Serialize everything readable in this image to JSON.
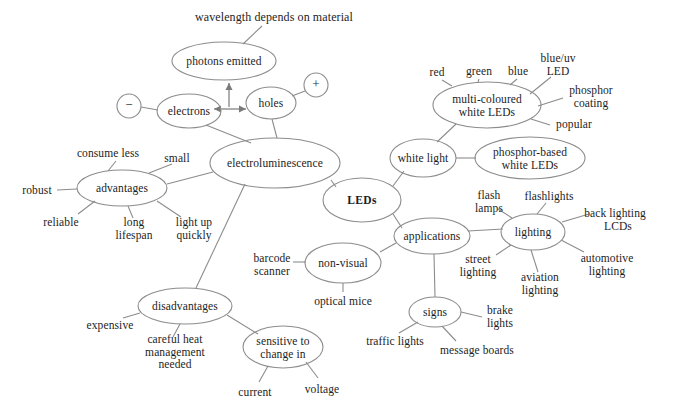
{
  "diagram": {
    "type": "mind-map",
    "stroke_color": "#8c8c8c",
    "text_color": "#1d1d1d",
    "background_color": "#ffffff",
    "root": "LEDs",
    "nodes": [
      {
        "id": "leds",
        "label": "LEDs",
        "shape": "ellipse",
        "bold": true,
        "cx": 362,
        "cy": 200,
        "rx": 39,
        "ry": 22
      },
      {
        "id": "electro",
        "label": "electroluminescence",
        "shape": "ellipse",
        "bold": false,
        "cx": 275,
        "cy": 163,
        "rx": 65,
        "ry": 25
      },
      {
        "id": "whitelight",
        "label": "white light",
        "shape": "ellipse",
        "bold": false,
        "cx": 423,
        "cy": 158,
        "rx": 33,
        "ry": 19
      },
      {
        "id": "applications",
        "label": "applications",
        "shape": "ellipse",
        "bold": false,
        "cx": 432,
        "cy": 236,
        "rx": 38,
        "ry": 18
      },
      {
        "id": "advantages",
        "label": "advantages",
        "shape": "ellipse",
        "bold": false,
        "cx": 122,
        "cy": 188,
        "rx": 45,
        "ry": 18
      },
      {
        "id": "disadvantages",
        "label": "disadvantages",
        "shape": "ellipse",
        "bold": false,
        "cx": 185,
        "cy": 306,
        "rx": 47,
        "ry": 18
      },
      {
        "id": "photons",
        "label": "photons emitted",
        "shape": "ellipse",
        "bold": false,
        "cx": 224,
        "cy": 61,
        "rx": 52,
        "ry": 19
      },
      {
        "id": "electrons",
        "label": "electrons",
        "shape": "ellipse",
        "bold": false,
        "cx": 189,
        "cy": 111,
        "rx": 32,
        "ry": 17
      },
      {
        "id": "holes",
        "label": "holes",
        "shape": "ellipse",
        "bold": false,
        "cx": 271,
        "cy": 103,
        "rx": 25,
        "ry": 16
      },
      {
        "id": "minus",
        "label": "−",
        "shape": "ellipse",
        "bold": false,
        "cx": 129,
        "cy": 106,
        "rx": 12,
        "ry": 12
      },
      {
        "id": "plus",
        "label": "+",
        "shape": "ellipse",
        "bold": false,
        "cx": 316,
        "cy": 85,
        "rx": 12,
        "ry": 12
      },
      {
        "id": "multicoloured",
        "label": "multi-coloured\nwhite LEDs",
        "shape": "ellipse",
        "bold": false,
        "cx": 487,
        "cy": 105,
        "rx": 54,
        "ry": 23
      },
      {
        "id": "phosphorbased",
        "label": "phosphor-based\nwhite LEDs",
        "shape": "ellipse",
        "bold": false,
        "cx": 530,
        "cy": 158,
        "rx": 55,
        "ry": 21
      },
      {
        "id": "lighting",
        "label": "lighting",
        "shape": "ellipse",
        "bold": false,
        "cx": 533,
        "cy": 232,
        "rx": 32,
        "ry": 18
      },
      {
        "id": "nonvisual",
        "label": "non-visual",
        "shape": "ellipse",
        "bold": false,
        "cx": 343,
        "cy": 263,
        "rx": 38,
        "ry": 20
      },
      {
        "id": "signs",
        "label": "signs",
        "shape": "ellipse",
        "bold": false,
        "cx": 435,
        "cy": 312,
        "rx": 26,
        "ry": 15
      },
      {
        "id": "sensitive",
        "label": "sensitive to\nchange in",
        "shape": "ellipse",
        "bold": false,
        "cx": 283,
        "cy": 347,
        "rx": 40,
        "ry": 21
      }
    ],
    "leaves": [
      {
        "id": "wavelength",
        "label": "wavelength depends on material",
        "x": 274,
        "y": 17,
        "align": "center"
      },
      {
        "id": "small",
        "label": "small",
        "x": 177,
        "y": 158,
        "align": "center"
      },
      {
        "id": "consume-less",
        "label": "consume less",
        "x": 108,
        "y": 153,
        "align": "center"
      },
      {
        "id": "robust",
        "label": "robust",
        "x": 37,
        "y": 190,
        "align": "center"
      },
      {
        "id": "reliable",
        "label": "reliable",
        "x": 61,
        "y": 222,
        "align": "center"
      },
      {
        "id": "long-lifespan",
        "label": "long\nlifespan",
        "x": 134,
        "y": 228,
        "align": "center"
      },
      {
        "id": "light-up-quickly",
        "label": "light up\nquickly",
        "x": 194,
        "y": 228,
        "align": "center"
      },
      {
        "id": "expensive",
        "label": "expensive",
        "x": 110,
        "y": 325,
        "align": "center"
      },
      {
        "id": "careful-heat",
        "label": "careful heat\nmanagement\nneeded",
        "x": 175,
        "y": 352,
        "align": "center"
      },
      {
        "id": "current",
        "label": "current",
        "x": 255,
        "y": 392,
        "align": "center"
      },
      {
        "id": "voltage",
        "label": "voltage",
        "x": 322,
        "y": 389,
        "align": "center"
      },
      {
        "id": "barcode-scanner",
        "label": "barcode\nscanner",
        "x": 272,
        "y": 264,
        "align": "center"
      },
      {
        "id": "optical-mice",
        "label": "optical mice",
        "x": 343,
        "y": 301,
        "align": "center"
      },
      {
        "id": "traffic-lights",
        "label": "traffic lights",
        "x": 395,
        "y": 341,
        "align": "center"
      },
      {
        "id": "message-boards",
        "label": "message boards",
        "x": 477,
        "y": 350,
        "align": "center"
      },
      {
        "id": "brake-lights",
        "label": "brake\nlights",
        "x": 500,
        "y": 316,
        "align": "center"
      },
      {
        "id": "street-lighting",
        "label": "street\nlighting",
        "x": 478,
        "y": 265,
        "align": "center"
      },
      {
        "id": "aviation-lighting",
        "label": "aviation\nlighting",
        "x": 540,
        "y": 283,
        "align": "center"
      },
      {
        "id": "automotive-lighting",
        "label": "automotive\nlighting",
        "x": 607,
        "y": 264,
        "align": "center"
      },
      {
        "id": "back-lighting-lcds",
        "label": "back lighting\n  LCDs",
        "x": 615,
        "y": 219,
        "align": "center"
      },
      {
        "id": "flashlights",
        "label": "flashlights",
        "x": 549,
        "y": 196,
        "align": "center"
      },
      {
        "id": "flash-lamps",
        "label": "flash\nlamps",
        "x": 489,
        "y": 201,
        "align": "center"
      },
      {
        "id": "red",
        "label": "red",
        "x": 437,
        "y": 72,
        "align": "center"
      },
      {
        "id": "green",
        "label": "green",
        "x": 479,
        "y": 71,
        "align": "center"
      },
      {
        "id": "blue",
        "label": "blue",
        "x": 518,
        "y": 71,
        "align": "center"
      },
      {
        "id": "blue-uv-led",
        "label": "blue/uv\nLED",
        "x": 558,
        "y": 64,
        "align": "center"
      },
      {
        "id": "phosphor-coating",
        "label": "phosphor\ncoating",
        "x": 591,
        "y": 96,
        "align": "center"
      },
      {
        "id": "popular",
        "label": "popular",
        "x": 574,
        "y": 124,
        "align": "center"
      }
    ],
    "edges": [
      {
        "from": "electro",
        "to": "leds",
        "x1": 331,
        "y1": 180,
        "x2": 336,
        "y2": 187
      },
      {
        "from": "leds",
        "to": "whitelight",
        "x1": 393,
        "y1": 186,
        "x2": 404,
        "y2": 171
      },
      {
        "from": "leds",
        "to": "applications",
        "x1": 393,
        "y1": 214,
        "x2": 400,
        "y2": 228
      },
      {
        "from": "electro",
        "to": "advantages",
        "x1": 213,
        "y1": 172,
        "x2": 167,
        "y2": 184
      },
      {
        "from": "electro",
        "to": "disadvantages",
        "x1": 244,
        "y1": 185,
        "x2": 195,
        "y2": 288
      },
      {
        "from": "electro",
        "to": "electrons",
        "x1": 253,
        "y1": 141,
        "x2": 205,
        "y2": 126
      },
      {
        "from": "electro",
        "to": "holes",
        "x1": 278,
        "y1": 138,
        "x2": 272,
        "y2": 119
      },
      {
        "from": "photons",
        "to": "wavelength",
        "x1": 243,
        "y1": 44,
        "x2": 262,
        "y2": 26
      },
      {
        "from": "minus",
        "to": "electrons",
        "x1": 141,
        "y1": 107,
        "x2": 158,
        "y2": 110
      },
      {
        "from": "plus",
        "to": "holes",
        "x1": 305,
        "y1": 91,
        "x2": 291,
        "y2": 97
      },
      {
        "from": "advantages",
        "to": "consume-less",
        "x1": 108,
        "y1": 171,
        "x2": 116,
        "y2": 161
      },
      {
        "from": "advantages",
        "to": "small",
        "x1": 148,
        "y1": 173,
        "x2": 171,
        "y2": 164
      },
      {
        "from": "advantages",
        "to": "robust",
        "x1": 77,
        "y1": 189,
        "x2": 57,
        "y2": 190
      },
      {
        "from": "advantages",
        "to": "reliable",
        "x1": 93,
        "y1": 201,
        "x2": 77,
        "y2": 215
      },
      {
        "from": "advantages",
        "to": "long-lifespan",
        "x1": 127,
        "y1": 206,
        "x2": 132,
        "y2": 218
      },
      {
        "from": "advantages",
        "to": "light-up",
        "x1": 156,
        "y1": 202,
        "x2": 180,
        "y2": 217
      },
      {
        "from": "disadvantages",
        "to": "expensive",
        "x1": 140,
        "y1": 313,
        "x2": 122,
        "y2": 318
      },
      {
        "from": "disadvantages",
        "to": "careful-heat",
        "x1": 179,
        "y1": 324,
        "x2": 172,
        "y2": 337
      },
      {
        "from": "disadvantages",
        "to": "sensitive",
        "x1": 227,
        "y1": 315,
        "x2": 258,
        "y2": 334
      },
      {
        "from": "sensitive",
        "to": "current",
        "x1": 268,
        "y1": 366,
        "x2": 258,
        "y2": 382
      },
      {
        "from": "sensitive",
        "to": "voltage",
        "x1": 306,
        "y1": 362,
        "x2": 318,
        "y2": 378
      },
      {
        "from": "applications",
        "to": "nonvisual",
        "x1": 396,
        "y1": 243,
        "x2": 379,
        "y2": 253
      },
      {
        "from": "applications",
        "to": "signs",
        "x1": 434,
        "y1": 254,
        "x2": 435,
        "y2": 297
      },
      {
        "from": "applications",
        "to": "lighting",
        "x1": 466,
        "y1": 230,
        "x2": 503,
        "y2": 228
      },
      {
        "from": "nonvisual",
        "to": "barcode",
        "x1": 306,
        "y1": 262,
        "x2": 292,
        "y2": 262
      },
      {
        "from": "nonvisual",
        "to": "optical-mice",
        "x1": 343,
        "y1": 283,
        "x2": 343,
        "y2": 292
      },
      {
        "from": "signs",
        "to": "traffic",
        "x1": 417,
        "y1": 323,
        "x2": 398,
        "y2": 333
      },
      {
        "from": "signs",
        "to": "message",
        "x1": 441,
        "y1": 327,
        "x2": 455,
        "y2": 341
      },
      {
        "from": "signs",
        "to": "brake",
        "x1": 461,
        "y1": 313,
        "x2": 482,
        "y2": 317
      },
      {
        "from": "lighting",
        "to": "street",
        "x1": 510,
        "y1": 245,
        "x2": 495,
        "y2": 255
      },
      {
        "from": "lighting",
        "to": "aviation",
        "x1": 531,
        "y1": 250,
        "x2": 538,
        "y2": 272
      },
      {
        "from": "lighting",
        "to": "automotive",
        "x1": 562,
        "y1": 240,
        "x2": 583,
        "y2": 252
      },
      {
        "from": "lighting",
        "to": "backlighting",
        "x1": 562,
        "y1": 222,
        "x2": 588,
        "y2": 214
      },
      {
        "from": "lighting",
        "to": "flashlights",
        "x1": 537,
        "y1": 214,
        "x2": 545,
        "y2": 203
      },
      {
        "from": "lighting",
        "to": "flash-lamps",
        "x1": 511,
        "y1": 218,
        "x2": 497,
        "y2": 209
      },
      {
        "from": "whitelight",
        "to": "multicoloured",
        "x1": 437,
        "y1": 142,
        "x2": 455,
        "y2": 123
      },
      {
        "from": "whitelight",
        "to": "phosphorbased",
        "x1": 456,
        "y1": 158,
        "x2": 475,
        "y2": 158
      },
      {
        "from": "multicoloured",
        "to": "red",
        "x1": 451,
        "y1": 86,
        "x2": 441,
        "y2": 80
      },
      {
        "from": "multicoloured",
        "to": "green",
        "x1": 478,
        "y1": 82,
        "x2": 479,
        "y2": 79
      },
      {
        "from": "multicoloured",
        "to": "blue",
        "x1": 509,
        "y1": 85,
        "x2": 517,
        "y2": 79
      },
      {
        "from": "multicoloured",
        "to": "blue-uv",
        "x1": 530,
        "y1": 94,
        "x2": 551,
        "y2": 77
      },
      {
        "from": "multicoloured",
        "to": "phosphor-coat",
        "x1": 537,
        "y1": 106,
        "x2": 562,
        "y2": 98
      },
      {
        "from": "multicoloured",
        "to": "popular",
        "x1": 530,
        "y1": 119,
        "x2": 549,
        "y2": 125
      }
    ],
    "arrows": [
      {
        "id": "electrons-holes-arrow",
        "label": "double-headed-arrow",
        "x1": 212,
        "y1": 109,
        "x2": 247,
        "y2": 109,
        "heads": "both"
      },
      {
        "id": "recombination-arrow",
        "label": "up-arrow-to-photons",
        "x1": 229,
        "y1": 108,
        "x2": 229,
        "y2": 82,
        "heads": "end"
      }
    ]
  }
}
